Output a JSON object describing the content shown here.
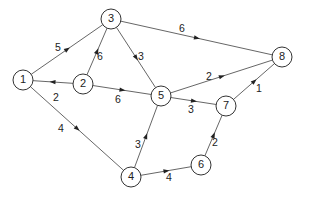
{
  "graph": {
    "type": "directed-weighted",
    "nodes": [
      {
        "id": "1",
        "label": "1",
        "x": 23,
        "y": 80
      },
      {
        "id": "2",
        "label": "2",
        "x": 83,
        "y": 84
      },
      {
        "id": "3",
        "label": "3",
        "x": 111,
        "y": 19
      },
      {
        "id": "4",
        "label": "4",
        "x": 131,
        "y": 177
      },
      {
        "id": "5",
        "label": "5",
        "x": 161,
        "y": 96
      },
      {
        "id": "6",
        "label": "6",
        "x": 201,
        "y": 165
      },
      {
        "id": "7",
        "label": "7",
        "x": 226,
        "y": 106
      },
      {
        "id": "8",
        "label": "8",
        "x": 282,
        "y": 57
      }
    ],
    "edges": [
      {
        "from": "1",
        "to": "3",
        "weight": "5",
        "lx": 58,
        "ly": 48
      },
      {
        "from": "2",
        "to": "1",
        "weight": "2",
        "lx": 56,
        "ly": 98
      },
      {
        "from": "2",
        "to": "3",
        "weight": "6",
        "lx": 100,
        "ly": 57
      },
      {
        "from": "3",
        "to": "5",
        "weight": "3",
        "lx": 141,
        "ly": 57
      },
      {
        "from": "3",
        "to": "8",
        "weight": "6",
        "lx": 182,
        "ly": 29
      },
      {
        "from": "2",
        "to": "5",
        "weight": "6",
        "lx": 118,
        "ly": 100
      },
      {
        "from": "1",
        "to": "4",
        "weight": "4",
        "lx": 61,
        "ly": 129
      },
      {
        "from": "4",
        "to": "5",
        "weight": "3",
        "lx": 138,
        "ly": 145
      },
      {
        "from": "4",
        "to": "6",
        "weight": "4",
        "lx": 169,
        "ly": 178
      },
      {
        "from": "5",
        "to": "8",
        "weight": "2",
        "lx": 209,
        "ly": 77
      },
      {
        "from": "5",
        "to": "7",
        "weight": "3",
        "lx": 191,
        "ly": 110
      },
      {
        "from": "6",
        "to": "7",
        "weight": "2",
        "lx": 215,
        "ly": 143
      },
      {
        "from": "7",
        "to": "8",
        "weight": "1",
        "lx": 259,
        "ly": 89
      }
    ]
  }
}
